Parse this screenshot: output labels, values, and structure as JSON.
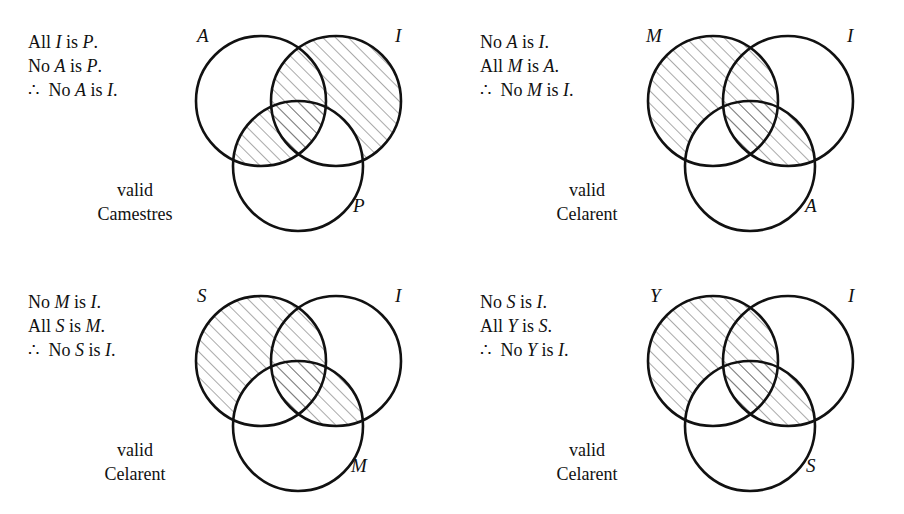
{
  "page": {
    "background": "#ffffff",
    "ink": "#111111"
  },
  "panels": [
    {
      "id": "top-left",
      "premises": [
        {
          "prefix": "All ",
          "t1": "I",
          "mid": " is ",
          "t2": "P",
          "suffix": "."
        },
        {
          "prefix": "No ",
          "t1": "A",
          "mid": " is ",
          "t2": "P",
          "suffix": "."
        }
      ],
      "conclusion": {
        "symbol": "∴",
        "prefix": " No ",
        "t1": "A",
        "mid": " is ",
        "t2": "I",
        "suffix": "."
      },
      "verdict_line1": "valid",
      "verdict_line2": "Camestres",
      "labels": {
        "left": "A",
        "right": "I",
        "bottom": "P"
      },
      "shaded_regions": [
        "right-only",
        "left-right-overlap",
        "left-bottom-overlap",
        "center"
      ]
    },
    {
      "id": "top-right",
      "premises": [
        {
          "prefix": "No ",
          "t1": "A",
          "mid": " is ",
          "t2": "I",
          "suffix": "."
        },
        {
          "prefix": "All ",
          "t1": "M",
          "mid": " is ",
          "t2": "A",
          "suffix": "."
        }
      ],
      "conclusion": {
        "symbol": "∴",
        "prefix": " No ",
        "t1": "M",
        "mid": " is ",
        "t2": "I",
        "suffix": "."
      },
      "verdict_line1": "valid",
      "verdict_line2": "Celarent",
      "labels": {
        "left": "M",
        "right": "I",
        "bottom": "A"
      },
      "shaded_regions": [
        "left-only",
        "left-right-overlap",
        "center",
        "right-bottom-overlap"
      ]
    },
    {
      "id": "bottom-left",
      "premises": [
        {
          "prefix": "No ",
          "t1": "M",
          "mid": " is ",
          "t2": "I",
          "suffix": "."
        },
        {
          "prefix": "All ",
          "t1": "S",
          "mid": " is ",
          "t2": "M",
          "suffix": "."
        }
      ],
      "conclusion": {
        "symbol": "∴",
        "prefix": " No ",
        "t1": "S",
        "mid": " is ",
        "t2": "I",
        "suffix": "."
      },
      "verdict_line1": "valid",
      "verdict_line2": "Celarent",
      "labels": {
        "left": "S",
        "right": "I",
        "bottom": "M"
      },
      "shaded_regions": [
        "left-only",
        "left-right-overlap",
        "center",
        "right-bottom-overlap"
      ]
    },
    {
      "id": "bottom-right",
      "premises": [
        {
          "prefix": "No ",
          "t1": "S",
          "mid": " is ",
          "t2": "I",
          "suffix": "."
        },
        {
          "prefix": "All ",
          "t1": "Y",
          "mid": " is ",
          "t2": "S",
          "suffix": "."
        }
      ],
      "conclusion": {
        "symbol": "∴",
        "prefix": " No ",
        "t1": "Y",
        "mid": " is ",
        "t2": "I",
        "suffix": "."
      },
      "verdict_line1": "valid",
      "verdict_line2": "Celarent",
      "labels": {
        "left": "Y",
        "right": "I",
        "bottom": "S"
      },
      "shaded_regions": [
        "left-only",
        "left-right-overlap",
        "center",
        "right-bottom-overlap"
      ]
    }
  ]
}
